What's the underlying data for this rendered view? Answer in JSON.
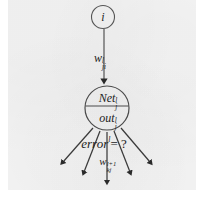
{
  "figure": {
    "kind": "neural-network-backpropagation-diagram",
    "background_color": "#ffffff",
    "panel_color": "#f4f4f4",
    "ink_color": "#232323"
  },
  "nodes": {
    "upper": {
      "label": "i",
      "shape": "circle",
      "cx": 103,
      "cy": 17,
      "r": 11
    },
    "main": {
      "shape": "circle-split-horizontal",
      "cx": 107,
      "cy": 108,
      "r": 22,
      "top_cell": {
        "base": "Net",
        "superscript": "l",
        "subscript": "j"
      },
      "bottom_cell": {
        "base": "out",
        "superscript": "l",
        "subscript": "j"
      }
    }
  },
  "labels": {
    "incoming_weight": {
      "base": "w",
      "superscript": "l",
      "subscript": "ji"
    },
    "error_query": {
      "base": "error",
      "superscript": "l",
      "equals": "= ?"
    },
    "outgoing_weight": {
      "base": "w",
      "superscript": "l+1",
      "subscript": "kj"
    }
  },
  "edges": {
    "incoming": {
      "from_node": "upper",
      "to_node": "main",
      "arrowhead": "solid-triangle-down"
    },
    "outgoing_fan": {
      "count": 5,
      "arrowhead": "solid-triangle",
      "direction": "downward-fan"
    }
  }
}
